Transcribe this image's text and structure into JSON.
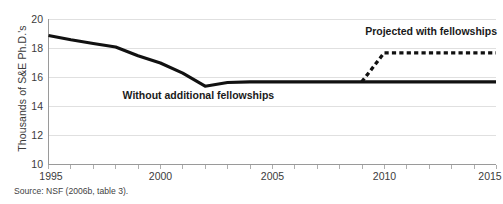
{
  "chart_data": {
    "type": "line",
    "title": "",
    "xlabel": "",
    "ylabel": "Thousands of S&E Ph.D.'s",
    "xlim": [
      1995,
      2015
    ],
    "ylim": [
      10,
      20
    ],
    "grid": true,
    "legend_position": "inline-annotations",
    "x_ticks": [
      1995,
      2000,
      2005,
      2010,
      2015
    ],
    "x_tick_labels": [
      "1995",
      "2000",
      "2005",
      "2010",
      "2015"
    ],
    "x_minor_tick_interval": 1,
    "y_ticks": [
      10,
      12,
      14,
      16,
      18,
      20
    ],
    "y_tick_labels": [
      "10",
      "12",
      "14",
      "16",
      "18",
      "20"
    ],
    "series": [
      {
        "name": "Without additional fellowships",
        "style": "solid",
        "color": "#111111",
        "x": [
          1995,
          1996,
          1997,
          1998,
          1999,
          2000,
          2001,
          2002,
          2003,
          2004,
          2005,
          2006,
          2007,
          2008,
          2009,
          2010,
          2011,
          2012,
          2013,
          2014,
          2015
        ],
        "values": [
          18.9,
          18.6,
          18.35,
          18.1,
          17.5,
          17.0,
          16.3,
          15.4,
          15.65,
          15.7,
          15.7,
          15.7,
          15.7,
          15.7,
          15.7,
          15.7,
          15.7,
          15.7,
          15.7,
          15.7,
          15.7
        ]
      },
      {
        "name": "Projected with fellowships",
        "style": "dashed",
        "color": "#111111",
        "x": [
          2009,
          2010,
          2011,
          2012,
          2013,
          2014,
          2015
        ],
        "values": [
          15.7,
          17.7,
          17.7,
          17.7,
          17.7,
          17.7,
          17.7
        ]
      }
    ],
    "annotations": [
      {
        "text": "Without additional fellowships",
        "x": 2001.7,
        "y": 14.55
      },
      {
        "text": "Projected with fellowships",
        "x": 2012.1,
        "y": 18.95
      }
    ]
  },
  "source_note": "Source: NSF (2006b, table 3)."
}
